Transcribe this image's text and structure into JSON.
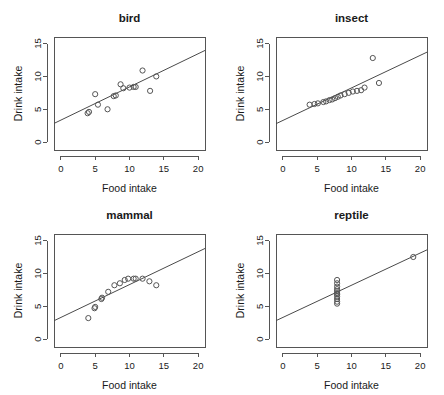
{
  "figure": {
    "layout": "2x2 panel grid of scatterplots with fitted regression lines",
    "background_color": "#ffffff",
    "point_color": "#555555",
    "line_color": "#4a4a4a"
  },
  "chart_data": [
    {
      "type": "scatter",
      "title": "bird",
      "xlabel": "Food intake",
      "ylabel": "Drink intake",
      "xlim": [
        -1,
        21
      ],
      "ylim": [
        -1.2,
        16
      ],
      "xticks": [
        0,
        5,
        10,
        15,
        20
      ],
      "yticks": [
        0,
        5,
        10,
        15
      ],
      "grid": false,
      "legend": "none",
      "x": [
        3.9,
        4.1,
        5.0,
        5.4,
        6.8,
        7.7,
        8.0,
        8.7,
        9.1,
        10.0,
        10.6,
        10.9,
        11.9,
        13.0,
        13.9
      ],
      "y": [
        4.4,
        4.6,
        7.3,
        5.7,
        5.0,
        7.0,
        7.1,
        8.8,
        8.2,
        8.3,
        8.4,
        8.4,
        10.9,
        7.8,
        10.0
      ],
      "fit_line": {
        "intercept": 3.35,
        "slope": 0.505
      }
    },
    {
      "type": "scatter",
      "title": "insect",
      "xlabel": "Food intake",
      "ylabel": "Drink intake",
      "xlim": [
        -1,
        21
      ],
      "ylim": [
        -1.2,
        16
      ],
      "xticks": [
        0,
        5,
        10,
        15,
        20
      ],
      "yticks": [
        0,
        5,
        10,
        15
      ],
      "grid": false,
      "legend": "none",
      "x": [
        3.9,
        4.6,
        5.1,
        5.9,
        6.3,
        6.8,
        7.2,
        7.6,
        8.0,
        8.4,
        9.0,
        9.6,
        10.2,
        10.8,
        11.4,
        11.9,
        13.1,
        14.0
      ],
      "y": [
        5.7,
        5.8,
        5.9,
        6.1,
        6.2,
        6.4,
        6.5,
        6.7,
        6.9,
        7.1,
        7.3,
        7.5,
        7.7,
        7.8,
        7.9,
        8.3,
        12.8,
        9.0
      ],
      "fit_line": {
        "intercept": 3.3,
        "slope": 0.495
      }
    },
    {
      "type": "scatter",
      "title": "mammal",
      "xlabel": "Food intake",
      "ylabel": "Drink intake",
      "xlim": [
        -1,
        21
      ],
      "ylim": [
        -1.2,
        16
      ],
      "xticks": [
        0,
        5,
        10,
        15,
        20
      ],
      "yticks": [
        0,
        5,
        10,
        15
      ],
      "grid": false,
      "legend": "none",
      "x": [
        4.0,
        4.9,
        5.0,
        5.9,
        6.0,
        6.9,
        7.8,
        8.6,
        9.3,
        9.8,
        10.6,
        10.9,
        11.9,
        12.9,
        13.9
      ],
      "y": [
        3.2,
        4.7,
        4.9,
        6.1,
        6.3,
        7.2,
        8.2,
        8.5,
        9.0,
        9.2,
        9.2,
        9.2,
        9.2,
        8.8,
        8.2
      ],
      "fit_line": {
        "intercept": 3.3,
        "slope": 0.5
      }
    },
    {
      "type": "scatter",
      "title": "reptile",
      "xlabel": "Food intake",
      "ylabel": "Drink intake",
      "xlim": [
        -1,
        21
      ],
      "ylim": [
        -1.2,
        16
      ],
      "xticks": [
        0,
        5,
        10,
        15,
        20
      ],
      "yticks": [
        0,
        5,
        10,
        15
      ],
      "grid": false,
      "legend": "none",
      "x": [
        7.9,
        7.9,
        7.9,
        7.9,
        7.9,
        7.9,
        7.9,
        7.9,
        7.9,
        7.9,
        7.9,
        19.0
      ],
      "y": [
        5.4,
        5.7,
        6.1,
        6.5,
        6.8,
        7.0,
        7.3,
        7.6,
        8.0,
        8.5,
        9.0,
        12.5
      ],
      "fit_line": {
        "intercept": 3.3,
        "slope": 0.49
      }
    }
  ],
  "panels": [
    {
      "key": "bird",
      "title": "bird",
      "xlabel": "Food intake",
      "ylabel": "Drink intake"
    },
    {
      "key": "insect",
      "title": "insect",
      "xlabel": "Food intake",
      "ylabel": "Drink intake"
    },
    {
      "key": "mammal",
      "title": "mammal",
      "xlabel": "Food intake",
      "ylabel": "Drink intake"
    },
    {
      "key": "reptile",
      "title": "reptile",
      "xlabel": "Food intake",
      "ylabel": "Drink intake"
    }
  ]
}
